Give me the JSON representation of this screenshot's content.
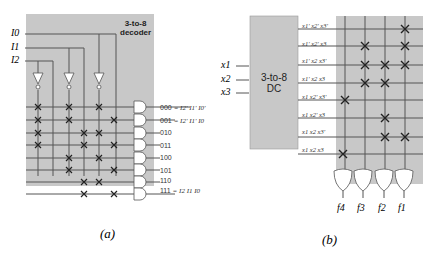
{
  "panel_a": {
    "title_line1": "3-to-8",
    "title_line2": "decoder",
    "inputs": [
      "I0",
      "I1",
      "I2"
    ],
    "outputs": [
      {
        "code": "000",
        "expr": "= I2' I1' I0'"
      },
      {
        "code": "001",
        "expr": "= I2' I1' I0"
      },
      {
        "code": "010",
        "expr": ""
      },
      {
        "code": "011",
        "expr": ""
      },
      {
        "code": "100",
        "expr": ""
      },
      {
        "code": "101",
        "expr": ""
      },
      {
        "code": "110",
        "expr": ""
      },
      {
        "code": "111",
        "expr": "= I2 I1 I0"
      }
    ],
    "caption": "(a)"
  },
  "panel_b": {
    "block_line1": "3-to-8",
    "block_line2": "DC",
    "inputs": [
      "x1",
      "x2",
      "x3"
    ],
    "minterms": [
      "x1' x2' x3'",
      "x1' x2' x3",
      "x1' x2 x3'",
      "x1' x2 x3",
      "x1 x2' x3'",
      "x1 x2' x3",
      "x1 x2 x3'",
      "x1 x2 x3"
    ],
    "outputs": [
      "f4",
      "f3",
      "f2",
      "f1"
    ],
    "caption": "(b)"
  },
  "colors": {
    "panel_fill": "#c8c8c8",
    "line": "#555555",
    "mark": "#222222"
  }
}
